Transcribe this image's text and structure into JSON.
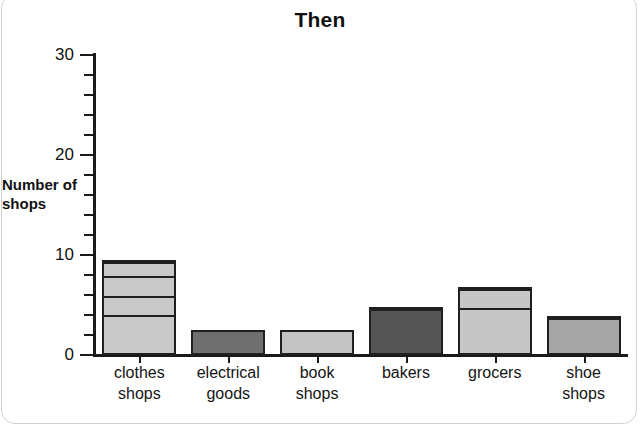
{
  "chart_data": {
    "type": "bar",
    "title": "Then",
    "xlabel": "",
    "ylabel": "Number of shops",
    "ylim": [
      0,
      30
    ],
    "ytick_major": [
      0,
      10,
      20,
      30
    ],
    "ytick_minor_step": 2,
    "grid": false,
    "legend": null,
    "stacked_segments": true,
    "categories": [
      "clothes shops",
      "electrical goods",
      "book shops",
      "bakers",
      "grocers",
      "shoe shops"
    ],
    "values": [
      9.5,
      2.5,
      2.5,
      4.8,
      6.8,
      3.9
    ],
    "bars": [
      {
        "category": "clothes shops",
        "label_lines": [
          "clothes",
          "shops"
        ],
        "total": 9.5,
        "color": "#c9c9c9",
        "segments": [
          2,
          2,
          2,
          2,
          1.5
        ]
      },
      {
        "category": "electrical goods",
        "label_lines": [
          "electrical",
          "goods"
        ],
        "total": 2.5,
        "color": "#6f6f6f",
        "segments": [
          2.5
        ]
      },
      {
        "category": "book shops",
        "label_lines": [
          "book",
          "shops"
        ],
        "total": 2.5,
        "color": "#c3c3c3",
        "segments": [
          2.5
        ]
      },
      {
        "category": "bakers",
        "label_lines": [
          "bakers"
        ],
        "total": 4.8,
        "color": "#555555",
        "segments": [
          2.4,
          2.4
        ]
      },
      {
        "category": "grocers",
        "label_lines": [
          "grocers"
        ],
        "total": 6.8,
        "color": "#c6c6c6",
        "segments": [
          2.6,
          2.2,
          2.0
        ]
      },
      {
        "category": "shoe shops",
        "label_lines": [
          "shoe",
          "shops"
        ],
        "total": 3.9,
        "color": "#a6a6a6",
        "segments": [
          2.6,
          1.3
        ]
      }
    ]
  },
  "axis": {
    "y_labels": [
      "30",
      "20",
      "10",
      "0"
    ],
    "y_title_lines": [
      "Number",
      "of shops"
    ]
  },
  "colors": {
    "axis": "#1a1a1a",
    "bar_outline": "#1f1f1f",
    "background": "#ffffff",
    "text": "#111111"
  }
}
